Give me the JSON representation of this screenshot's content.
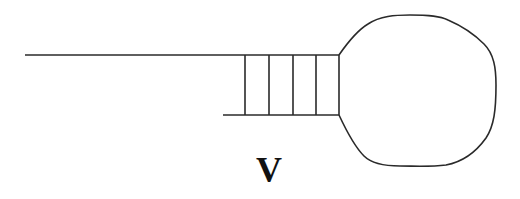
{
  "diagram": {
    "type": "stem-loop (hairpin) structure",
    "label": "V",
    "stem_rungs": 5,
    "colors": {
      "line": "#2a2a2a",
      "background": "#ffffff",
      "text": "#111111"
    }
  }
}
